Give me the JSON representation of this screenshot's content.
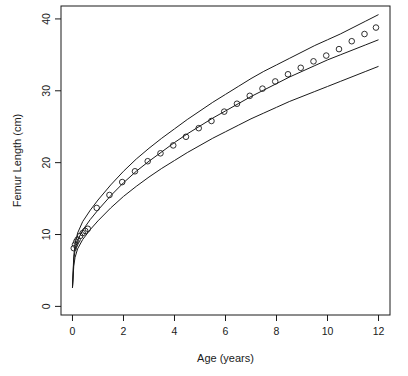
{
  "chart_data": {
    "type": "scatter",
    "title": "",
    "xlabel": "Age (years)",
    "ylabel": "Femur Length (cm)",
    "xlim": [
      -0.45,
      12.45
    ],
    "ylim": [
      -1.2,
      41.8
    ],
    "xticks": [
      0,
      2,
      4,
      6,
      8,
      10,
      12
    ],
    "xticklabels": [
      "0",
      "2",
      "4",
      "6",
      "8",
      "10",
      "12"
    ],
    "yticks": [
      0,
      10,
      20,
      30,
      40
    ],
    "yticklabels": [
      "0",
      "10",
      "20",
      "30",
      "40"
    ],
    "grid": false,
    "legend": null,
    "legend_position": "none",
    "point_marker": "open-circle",
    "point_color": "#1a1a1a",
    "line_color": "#1a1a1a",
    "background": "#ffffff",
    "annotations": [],
    "series": [
      {
        "name": "Observed femur length",
        "type": "scatter",
        "x": [
          0.05,
          0.1,
          0.15,
          0.2,
          0.3,
          0.4,
          0.5,
          0.6,
          0.95,
          1.45,
          1.95,
          2.45,
          2.95,
          3.45,
          3.95,
          4.45,
          4.95,
          5.45,
          5.95,
          6.45,
          6.95,
          7.45,
          7.95,
          8.45,
          8.95,
          9.45,
          9.95,
          10.45,
          10.95,
          11.45,
          11.9
        ],
        "y": [
          8.1,
          8.6,
          9.0,
          9.3,
          9.8,
          10.2,
          10.5,
          10.8,
          13.7,
          15.5,
          17.3,
          18.8,
          20.2,
          21.3,
          22.4,
          23.6,
          24.8,
          25.8,
          27.1,
          28.2,
          29.3,
          30.3,
          31.3,
          32.3,
          33.2,
          34.1,
          34.9,
          35.8,
          36.9,
          37.9,
          38.8
        ]
      },
      {
        "name": "Upper reference curve",
        "type": "line",
        "x": [
          0.0,
          0.05,
          0.1,
          0.2,
          0.4,
          0.7,
          1.0,
          1.5,
          2.0,
          2.5,
          3.0,
          3.5,
          4.0,
          4.5,
          5.0,
          5.5,
          6.0,
          6.5,
          7.0,
          7.5,
          8.0,
          8.5,
          9.0,
          9.5,
          10.0,
          10.5,
          11.0,
          11.5,
          12.0
        ],
        "y": [
          2.6,
          7.0,
          8.6,
          10.2,
          11.8,
          13.4,
          14.8,
          16.9,
          18.8,
          20.5,
          22.0,
          23.4,
          24.7,
          26.0,
          27.2,
          28.4,
          29.5,
          30.6,
          31.7,
          32.7,
          33.6,
          34.5,
          35.4,
          36.3,
          37.1,
          37.9,
          38.8,
          39.7,
          40.6
        ]
      },
      {
        "name": "Median reference curve",
        "type": "line",
        "x": [
          0.0,
          0.05,
          0.1,
          0.2,
          0.4,
          0.7,
          1.0,
          1.5,
          2.0,
          2.5,
          3.0,
          3.5,
          4.0,
          4.5,
          5.0,
          5.5,
          6.0,
          6.5,
          7.0,
          7.5,
          8.0,
          8.5,
          9.0,
          9.5,
          10.0,
          10.5,
          11.0,
          11.5,
          12.0
        ],
        "y": [
          2.6,
          6.4,
          7.8,
          9.2,
          10.6,
          12.1,
          13.4,
          15.4,
          17.2,
          18.8,
          20.2,
          21.5,
          22.8,
          24.0,
          25.1,
          26.2,
          27.2,
          28.2,
          29.2,
          30.1,
          31.0,
          31.9,
          32.7,
          33.5,
          34.3,
          35.0,
          35.7,
          36.4,
          37.1
        ]
      },
      {
        "name": "Lower reference curve",
        "type": "line",
        "x": [
          0.0,
          0.05,
          0.1,
          0.2,
          0.4,
          0.7,
          1.0,
          1.5,
          2.0,
          2.5,
          3.0,
          3.5,
          4.0,
          4.5,
          5.0,
          5.5,
          6.0,
          6.5,
          7.0,
          7.5,
          8.0,
          8.5,
          9.0,
          9.5,
          10.0,
          10.5,
          11.0,
          11.5,
          12.0
        ],
        "y": [
          2.6,
          5.6,
          6.8,
          8.0,
          9.3,
          10.7,
          11.9,
          13.7,
          15.3,
          16.7,
          18.0,
          19.2,
          20.3,
          21.4,
          22.4,
          23.4,
          24.3,
          25.2,
          26.1,
          26.9,
          27.7,
          28.5,
          29.2,
          29.9,
          30.6,
          31.3,
          32.0,
          32.7,
          33.4
        ]
      }
    ]
  }
}
